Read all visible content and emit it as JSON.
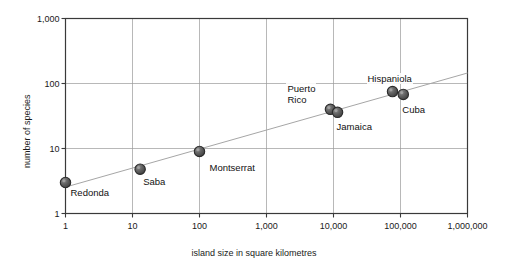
{
  "chart_data": {
    "type": "scatter",
    "title": "",
    "subtitle": "",
    "xlabel": "island size in square kilometres",
    "ylabel": "number of species",
    "xscale": "log",
    "yscale": "log",
    "xlim": [
      1,
      1000000
    ],
    "ylim": [
      1,
      1000
    ],
    "grid": true,
    "legend": "none",
    "xticks": [
      1,
      10,
      100,
      1000,
      10000,
      100000,
      1000000
    ],
    "xticklabels": [
      "1",
      "10",
      "100",
      "1,000",
      "10,000",
      "100,000",
      "1,000,000"
    ],
    "yticks": [
      1,
      10,
      100,
      1000
    ],
    "yticklabels": [
      "1",
      "10",
      "100",
      "1,000"
    ],
    "points": [
      {
        "name": "Redonda",
        "x": 1,
        "y": 3,
        "label": "Redonda",
        "label_dx": 4,
        "label_dy": 11,
        "label_align": "left"
      },
      {
        "name": "Saba",
        "x": 13,
        "y": 4.8,
        "label": "Saba",
        "label_dx": 2,
        "label_dy": 13,
        "label_align": "left"
      },
      {
        "name": "Montserrat",
        "x": 100,
        "y": 9,
        "label": "Montserrat",
        "label_dx": 9,
        "label_dy": 17,
        "label_align": "left"
      },
      {
        "name": "Puerto Rico",
        "x": 9000,
        "y": 40,
        "label": "Puerto\nRico",
        "label_dx": -44,
        "label_dy": -20,
        "label_align": "left"
      },
      {
        "name": "Jamaica",
        "x": 11500,
        "y": 36,
        "label": "Jamaica",
        "label_dx": -2,
        "label_dy": 15,
        "label_align": "left"
      },
      {
        "name": "Hispaniola",
        "x": 76000,
        "y": 75,
        "label": "Hispaniola",
        "label_dx": -26,
        "label_dy": -13,
        "label_align": "left"
      },
      {
        "name": "Cuba",
        "x": 110000,
        "y": 68,
        "label": "Cuba",
        "label_dx": -2,
        "label_dy": 16,
        "label_align": "left"
      }
    ],
    "trendline": {
      "description": "species-area regression line",
      "x_start": 1,
      "y_start": 2.55,
      "x_end": 1000000,
      "y_end": 145
    },
    "marker": {
      "fill_color": "#595959",
      "edge_color": "#2b2b2b",
      "radius_px": 5.2
    },
    "colors": {
      "axis": "#3a3a3a",
      "grid": "#9a9a9a",
      "trendline": "#a6a6a6",
      "text": "#1a1a1a",
      "background": "#ffffff"
    }
  }
}
